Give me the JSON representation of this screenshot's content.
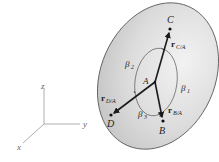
{
  "diagram": {
    "axes": {
      "x_label": "x",
      "y_label": "y",
      "z_label": "z"
    },
    "points": {
      "A": "A",
      "B": "B",
      "C": "C",
      "D": "D"
    },
    "vectors": {
      "rCA": {
        "main": "r",
        "sub": "C/A"
      },
      "rBA": {
        "main": "r",
        "sub": "B/A"
      },
      "rDA": {
        "main": "r",
        "sub": "D/A"
      }
    },
    "angles": {
      "beta1": {
        "main": "β",
        "sub": "1"
      },
      "beta2": {
        "main": "β",
        "sub": "2"
      },
      "beta3": {
        "main": "β",
        "sub": "3"
      }
    },
    "colors": {
      "disc_fill": "#d9d9d9",
      "disc_stroke": "#555555",
      "vector": "#1a1a1a",
      "axis": "#888888"
    }
  }
}
